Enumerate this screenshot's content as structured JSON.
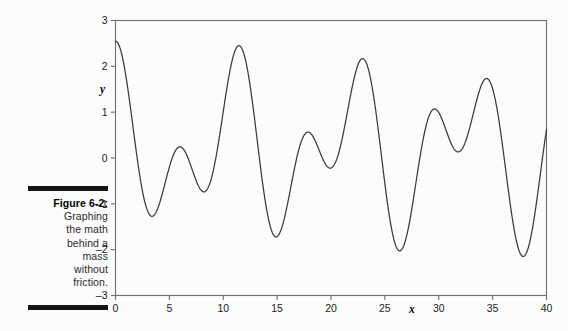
{
  "figure": {
    "caption_label": "Figure 6-2:",
    "caption_lines": [
      "Graphing",
      "the math",
      "behind a",
      "mass",
      "without",
      "friction."
    ],
    "rule_color": "#151515"
  },
  "chart_data": {
    "type": "line",
    "title": "",
    "xlabel": "x",
    "ylabel": "y",
    "xlim": [
      0,
      40
    ],
    "ylim": [
      -3,
      3
    ],
    "xticks": [
      0,
      5,
      10,
      15,
      20,
      25,
      30,
      35,
      40
    ],
    "yticks": [
      -3,
      -2,
      -1,
      0,
      1,
      2,
      3
    ],
    "xtick_labels": [
      "0",
      "5",
      "10",
      "15",
      "20",
      "25",
      "30",
      "35",
      "40"
    ],
    "ytick_labels": [
      "-3",
      "-2",
      "-1",
      "0",
      "1",
      "2",
      "3"
    ],
    "grid": false,
    "legend": null,
    "line_color": "#3a3a3a",
    "frame_color": "#6e6e6e",
    "series": [
      {
        "name": "y(x)",
        "formula": "1.2*cos(1.08*x) + 1.2*cos(0.58*x)",
        "amplitude_envelope_max": 2.35,
        "amplitude_envelope_min": -1.9,
        "beat_period": 12.7,
        "x": [
          0,
          1,
          2,
          3,
          4,
          5,
          6,
          7,
          8,
          9,
          10,
          11,
          12,
          13,
          14,
          15,
          16,
          17,
          18,
          19,
          20,
          21,
          22,
          23,
          24,
          25,
          26,
          27,
          28,
          29,
          30,
          31,
          32,
          33,
          34,
          35,
          36,
          37,
          38,
          39,
          40
        ],
        "values": [
          2.3,
          2.25,
          0.9,
          -0.9,
          -1.85,
          -1.5,
          -0.35,
          0.5,
          0.35,
          -0.6,
          -1.2,
          -0.7,
          0.85,
          2.3,
          2.15,
          0.55,
          -1.15,
          -1.85,
          -1.25,
          0.0,
          0.55,
          0.1,
          -0.85,
          -1.2,
          -0.3,
          1.35,
          2.35,
          1.8,
          0.1,
          -1.5,
          -1.85,
          -0.85,
          0.45,
          0.5,
          -0.35,
          -1.15,
          -0.95,
          0.4,
          2.05,
          2.3,
          0.3
        ]
      }
    ]
  }
}
